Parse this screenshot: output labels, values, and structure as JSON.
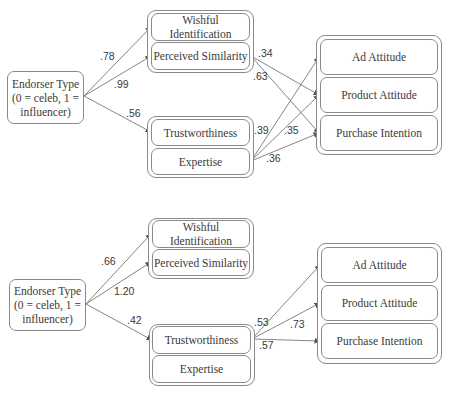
{
  "diagrams": [
    {
      "predictor": "Endorser Type (0 = celeb, 1 = influencer)",
      "predictor_lines": [
        "Endorser Type",
        "(0 = celeb, 1 =",
        "influencer)"
      ],
      "group1": {
        "items": [
          "Wishful Identification",
          "Perceived Similarity"
        ]
      },
      "group2": {
        "items": [
          "Trustworthiness",
          "Expertise"
        ]
      },
      "outcomes": {
        "items": [
          "Ad Attitude",
          "Product Attitude",
          "Purchase Intention"
        ]
      },
      "paths": [
        {
          "from": "Endorser Type",
          "to": "Wishful Identification",
          "label": ".78"
        },
        {
          "from": "Endorser Type",
          "to": "Perceived Similarity",
          "label": ".99"
        },
        {
          "from": "Endorser Type",
          "to": "Trustworthiness",
          "label": ".56"
        },
        {
          "from": "Perceived Similarity",
          "to": "Product Attitude",
          "label": ".34"
        },
        {
          "from": "Perceived Similarity",
          "to": "Purchase Intention",
          "label": ".63"
        },
        {
          "from": "Expertise",
          "to": "Ad Attitude",
          "label": ".39"
        },
        {
          "from": "Expertise",
          "to": "Product Attitude",
          "label": ".35"
        },
        {
          "from": "Expertise",
          "to": "Purchase Intention",
          "label": ".36"
        }
      ]
    },
    {
      "predictor": "Endorser Type (0 = celeb, 1 = influencer)",
      "predictor_lines": [
        "Endorser Type",
        "(0 = celeb, 1 =",
        "influencer)"
      ],
      "group1": {
        "items": [
          "Wishful Identification",
          "Perceived Similarity"
        ]
      },
      "group2": {
        "items": [
          "Trustworthiness",
          "Expertise"
        ]
      },
      "outcomes": {
        "items": [
          "Ad Attitude",
          "Product Attitude",
          "Purchase Intention"
        ]
      },
      "paths": [
        {
          "from": "Endorser Type",
          "to": "Wishful Identification",
          "label": ".66"
        },
        {
          "from": "Endorser Type",
          "to": "Perceived Similarity",
          "label": "1.20"
        },
        {
          "from": "Endorser Type",
          "to": "Trustworthiness",
          "label": ".42"
        },
        {
          "from": "Trustworthiness",
          "to": "Ad Attitude",
          "label": ".53"
        },
        {
          "from": "Trustworthiness",
          "to": "Product Attitude",
          "label": ".73"
        },
        {
          "from": "Trustworthiness",
          "to": "Purchase Intention",
          "label": ".57"
        }
      ]
    }
  ]
}
